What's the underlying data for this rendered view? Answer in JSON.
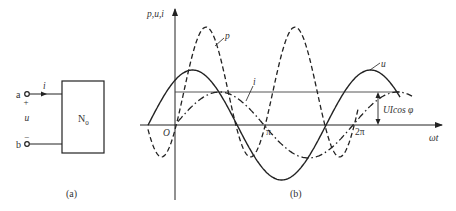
{
  "figure_a": {
    "caption": "(a)",
    "terminal_a": "a",
    "terminal_b": "b",
    "plus_sign": "+",
    "minus_sign": "−",
    "voltage_label": "u",
    "current_label": "i",
    "network_label": "N",
    "network_subscript": "0"
  },
  "figure_b": {
    "caption": "(b)",
    "y_axis_label": "p,u,i",
    "x_axis_label": "ωt",
    "origin_label": "O",
    "tick_pi": "π",
    "tick_2pi": "2π",
    "curve_labels": {
      "p": "p",
      "u": "u",
      "i": "i"
    },
    "mean_annotation": "UIcos φ"
  },
  "chart_data": {
    "type": "line",
    "title": "",
    "xlabel": "ωt",
    "ylabel": "p, u, i",
    "x_ticks": [
      "O",
      "π",
      "2π"
    ],
    "series": [
      {
        "name": "u",
        "style": "solid",
        "description": "sinusoidal voltage, leading current by phase angle φ",
        "amplitude_rel": 1.0,
        "phase_lead_rad": 0.95
      },
      {
        "name": "i",
        "style": "dash-dot",
        "description": "sinusoidal current, zero crossing near origin",
        "amplitude_rel": 0.6,
        "phase_lead_rad": 0.0
      },
      {
        "name": "p",
        "style": "dashed",
        "description": "instantaneous power p = u·i, twice the frequency, offset by mean UIcosφ",
        "mean_rel": 0.6,
        "amplitude_rel": 1.18
      }
    ],
    "annotations": [
      "UIcos φ (average power level)"
    ],
    "grid": false
  }
}
